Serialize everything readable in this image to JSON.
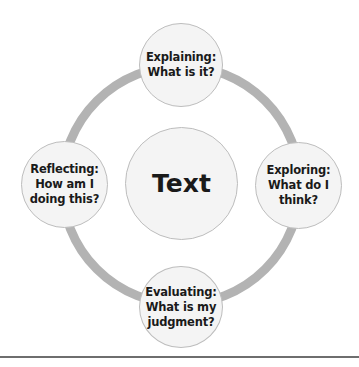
{
  "diagram": {
    "center": {
      "label": "Text"
    },
    "nodes": [
      {
        "id": "top",
        "label": "Explaining:\nWhat is it?"
      },
      {
        "id": "right",
        "label": "Exploring:\nWhat do I\nthink?"
      },
      {
        "id": "bottom",
        "label": "Evaluating:\nWhat is my\njudgment?"
      },
      {
        "id": "left",
        "label": "Reflecting:\nHow am I\ndoing this?"
      }
    ],
    "colors": {
      "ring": "#b3b3b3",
      "node_fill": "#f4f4f4",
      "node_border": "#bdbdbd",
      "text": "#1a1a1a",
      "rule": "#6e6e6e"
    }
  }
}
